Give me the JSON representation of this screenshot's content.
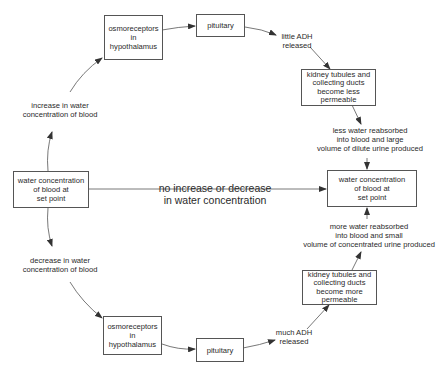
{
  "diagram": {
    "title": "",
    "colors": {
      "stroke": "#555555",
      "text": "#2a2a2a",
      "background": "#ffffff"
    },
    "nodes": {
      "left_set_point": {
        "lines": [
          "water concentration",
          "of blood at",
          "set point"
        ]
      },
      "right_set_point": {
        "lines": [
          "water concentration",
          "of blood at",
          "set point"
        ]
      },
      "top_osmoreceptors": {
        "lines": [
          "osmoreceptors",
          "in hypothalamus"
        ]
      },
      "top_pituitary": {
        "lines": [
          "pituitary"
        ]
      },
      "top_kidney": {
        "lines": [
          "kidney tubules and",
          "collecting ducts",
          "become less",
          "permeable"
        ]
      },
      "bottom_osmoreceptors": {
        "lines": [
          "osmoreceptors",
          "in",
          "hypothalamus"
        ]
      },
      "bottom_pituitary": {
        "lines": [
          "pituitary"
        ]
      },
      "bottom_kidney": {
        "lines": [
          "kidney tubules and",
          "collecting ducts",
          "become more",
          "permeable"
        ]
      }
    },
    "labels": {
      "increase": [
        "increase in water",
        "concentration of blood"
      ],
      "decrease": [
        "decrease in water",
        "concentration of blood"
      ],
      "little_adh": [
        "little ADH",
        "released"
      ],
      "much_adh": [
        "much ADH",
        "released"
      ],
      "less_water": [
        "less water reabsorbed",
        "into blood and large",
        "volume of dilute urine produced"
      ],
      "more_water": [
        "more water reabsorbed",
        "into blood and small",
        "volume of concentrated urine produced"
      ],
      "no_change": [
        "no increase or decrease",
        "in water concentration"
      ]
    }
  }
}
